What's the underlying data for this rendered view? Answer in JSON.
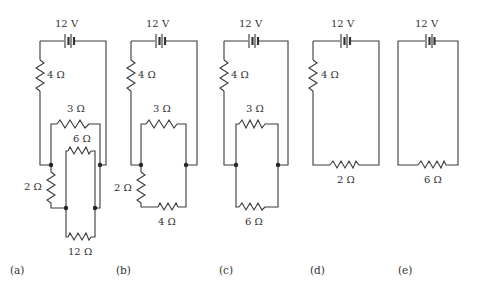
{
  "figure": {
    "panels": [
      {
        "id": "a",
        "caption": "(a)",
        "battery": "12 V",
        "resistors": [
          "4 Ω",
          "3 Ω",
          "6 Ω",
          "2 Ω",
          "12 Ω"
        ]
      },
      {
        "id": "b",
        "caption": "(b)",
        "battery": "12 V",
        "resistors": [
          "4 Ω",
          "3 Ω",
          "2 Ω",
          "4 Ω"
        ]
      },
      {
        "id": "c",
        "caption": "(c)",
        "battery": "12 V",
        "resistors": [
          "4 Ω",
          "3 Ω",
          "6 Ω"
        ]
      },
      {
        "id": "d",
        "caption": "(d)",
        "battery": "12 V",
        "resistors": [
          "4 Ω",
          "2 Ω"
        ]
      },
      {
        "id": "e",
        "caption": "(e)",
        "battery": "12 V",
        "resistors": [
          "6 Ω"
        ]
      }
    ]
  }
}
